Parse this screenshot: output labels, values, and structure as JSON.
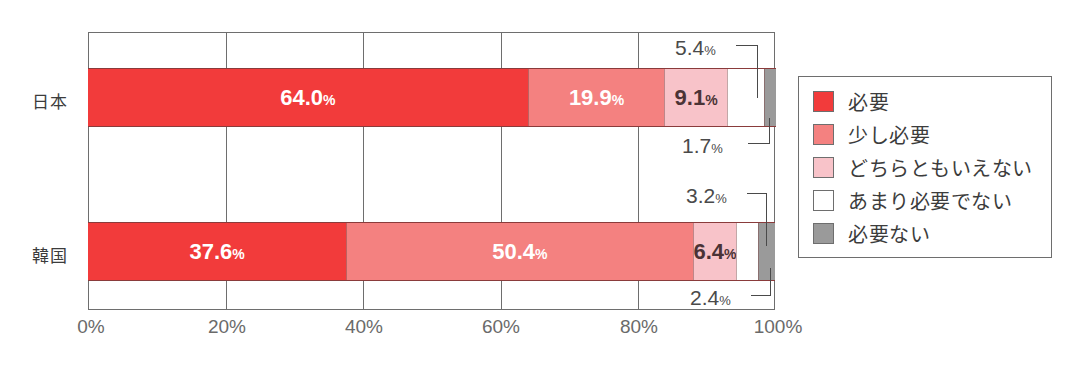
{
  "chart_data": {
    "type": "bar",
    "orientation": "horizontal",
    "stacked": true,
    "stacked_percent": true,
    "title": "",
    "xlabel": "",
    "ylabel": "",
    "xlim": [
      0,
      100
    ],
    "grid": true,
    "legend_position": "right",
    "categories": [
      "日本",
      "韓国"
    ],
    "tick_labels": [
      "0%",
      "20%",
      "40%",
      "60%",
      "80%",
      "100%"
    ],
    "tick_values": [
      0,
      20,
      40,
      60,
      80,
      100
    ],
    "series": [
      {
        "name": "必要",
        "color": "#f23b3b",
        "values": [
          64.0,
          37.6
        ]
      },
      {
        "name": "少し必要",
        "color": "#f48180",
        "values": [
          19.9,
          50.4
        ]
      },
      {
        "name": "どちらともいえない",
        "color": "#f8c3c9",
        "values": [
          9.1,
          6.4
        ]
      },
      {
        "name": "あまり必要でない",
        "color": "#ffffff",
        "values": [
          5.4,
          3.2
        ]
      },
      {
        "name": "必要ない",
        "color": "#9a9a9a",
        "values": [
          1.7,
          2.4
        ]
      }
    ]
  },
  "rows": [
    {
      "label": "日本",
      "segments": [
        {
          "value": "64.0",
          "unit": "%",
          "inside": true,
          "dark": false
        },
        {
          "value": "19.9",
          "unit": "%",
          "inside": true,
          "dark": false
        },
        {
          "value": "9.1",
          "unit": "%",
          "inside": true,
          "dark": true
        },
        {
          "value": "5.4",
          "unit": "%",
          "inside": false,
          "dark": true
        },
        {
          "value": "1.7",
          "unit": "%",
          "inside": false,
          "dark": true
        }
      ]
    },
    {
      "label": "韓国",
      "segments": [
        {
          "value": "37.6",
          "unit": "%",
          "inside": true,
          "dark": false
        },
        {
          "value": "50.4",
          "unit": "%",
          "inside": true,
          "dark": false
        },
        {
          "value": "6.4",
          "unit": "%",
          "inside": true,
          "dark": true
        },
        {
          "value": "3.2",
          "unit": "%",
          "inside": false,
          "dark": true
        },
        {
          "value": "2.4",
          "unit": "%",
          "inside": false,
          "dark": true
        }
      ]
    }
  ],
  "axis": {
    "ticks": [
      {
        "label": "0%",
        "x": 88
      },
      {
        "label": "20%",
        "x": 225
      },
      {
        "label": "40%",
        "x": 363
      },
      {
        "label": "60%",
        "x": 500
      },
      {
        "label": "80%",
        "x": 638
      },
      {
        "label": "100%",
        "x": 775
      }
    ]
  },
  "legend": {
    "items": [
      {
        "label": "必要",
        "color": "#f23b3b"
      },
      {
        "label": "少し必要",
        "color": "#f48180"
      },
      {
        "label": "どちらともいえない",
        "color": "#f8c3c9"
      },
      {
        "label": "あまり必要でない",
        "color": "#ffffff"
      },
      {
        "label": "必要ない",
        "color": "#9a9a9a"
      }
    ]
  },
  "callouts": {
    "jp_upper": {
      "value": "5.4",
      "unit": "%"
    },
    "jp_lower": {
      "value": "1.7",
      "unit": "%"
    },
    "kr_upper": {
      "value": "3.2",
      "unit": "%"
    },
    "kr_lower": {
      "value": "2.4",
      "unit": "%"
    }
  }
}
